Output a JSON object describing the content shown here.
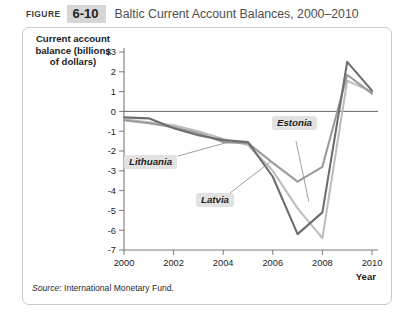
{
  "header": {
    "figure_word": "FIGURE",
    "figure_number": "6-10",
    "title": "Baltic Current Account Balances, 2000–2010"
  },
  "axis_title": "Current account balance (billions of dollars)",
  "source": {
    "prefix": "Source",
    "text": ": International Monetary Fund."
  },
  "labels": {
    "lithuania": "Lithuania",
    "latvia": "Latvia",
    "estonia": "Estonia"
  },
  "colors": {
    "estonia": "#6d6d6d",
    "latvia": "#bdbdbd",
    "lithuania": "#9b9b9b",
    "axis": "#7a7a7a",
    "panel_border": "#c9c9c9",
    "badge_bg": "#d6d6d6",
    "label_bg": "#e2e2e2"
  },
  "chart_data": {
    "type": "line",
    "title": "Baltic Current Account Balances, 2000–2010",
    "xlabel": "Year",
    "ylabel": "Current account balance (billions of dollars)",
    "x": [
      2000,
      2001,
      2002,
      2003,
      2004,
      2005,
      2006,
      2007,
      2008,
      2009,
      2010
    ],
    "xlim": [
      2000,
      2010
    ],
    "ylim": [
      -7,
      3
    ],
    "xticks": [
      2000,
      2002,
      2004,
      2006,
      2008,
      2010
    ],
    "xtick_labels": [
      "2000",
      "2002",
      "2004",
      "2006",
      "2008",
      "2010"
    ],
    "yticks": [
      3,
      2,
      1,
      0,
      -1,
      -2,
      -3,
      -4,
      -5,
      -6,
      -7
    ],
    "ytick_labels": [
      "$3",
      "2",
      "1",
      "0",
      "-1",
      "-2",
      "-3",
      "-4",
      "-5",
      "-6",
      "-7"
    ],
    "grid": false,
    "legend": "inline-callout-labels",
    "zero_line": true,
    "series": [
      {
        "name": "Estonia",
        "color": "#6d6d6d",
        "values": [
          -0.3,
          -0.35,
          -0.85,
          -1.2,
          -1.45,
          -1.55,
          -3.3,
          -6.2,
          -5.1,
          2.5,
          1.05
        ]
      },
      {
        "name": "Latvia",
        "color": "#bdbdbd",
        "values": [
          -0.4,
          -0.55,
          -0.7,
          -1.0,
          -1.4,
          -1.7,
          -3.0,
          -4.9,
          -6.4,
          1.55,
          1.0
        ]
      },
      {
        "name": "Lithuania",
        "color": "#9b9b9b",
        "values": [
          -0.45,
          -0.6,
          -0.8,
          -1.1,
          -1.55,
          -1.6,
          -2.6,
          -3.55,
          -2.8,
          1.85,
          0.9
        ]
      }
    ]
  }
}
